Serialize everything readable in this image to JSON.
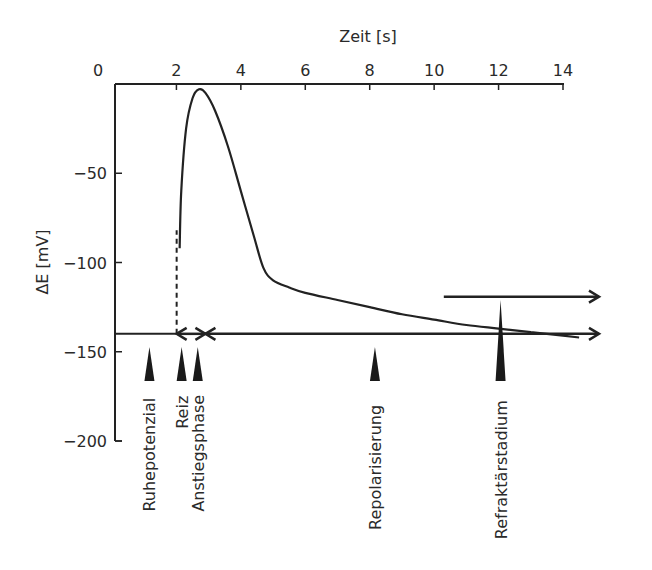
{
  "chart_data": {
    "type": "line",
    "title": "",
    "xlabel": "Zeit [s]",
    "ylabel": "ΔE  [mV]",
    "xlim": [
      0,
      14
    ],
    "ylim": [
      -200,
      0
    ],
    "x_ticks": [
      "0",
      "2",
      "4",
      "6",
      "8",
      "10",
      "12",
      "14"
    ],
    "y_ticks": [
      "−50",
      "−100",
      "−150",
      "−200"
    ],
    "x_axis_position": "top",
    "grid": false,
    "resting_potential_mV": -145,
    "series": [
      {
        "name": "Aktionspotenzial",
        "x": [
          2.1,
          2.15,
          2.3,
          2.5,
          2.7,
          2.9,
          3.2,
          3.6,
          4.0,
          4.4,
          4.7,
          5.0,
          5.5,
          6.0,
          7.0,
          8.0,
          9.0,
          10.0,
          11.0,
          12.0,
          13.0,
          14.0,
          14.5
        ],
        "y": [
          -92,
          -60,
          -25,
          -8,
          -3,
          -5,
          -15,
          -35,
          -60,
          -85,
          -103,
          -110,
          -114,
          -117,
          -121,
          -125,
          -129,
          -132,
          -135,
          -137,
          -139,
          -141,
          -142
        ]
      }
    ],
    "annotations": [
      {
        "label": "Ruhepotenzial",
        "x": 1.1,
        "type": "marker"
      },
      {
        "label": "Reiz",
        "x": 2.1,
        "type": "marker",
        "dashed_line_to_mV": -82
      },
      {
        "label": "Anstiegsphase",
        "x": 2.6,
        "type": "marker"
      },
      {
        "label": "Repolarisierung",
        "x": 8.1,
        "type": "marker"
      },
      {
        "label": "Refraktärstadium",
        "x": 12.0,
        "type": "tall-marker"
      }
    ],
    "arrows": [
      {
        "from_x": 2.1,
        "to_x": 2.9,
        "y_mV": -145,
        "style": "double-headed"
      },
      {
        "from_x": 2.9,
        "to_x": 14.0,
        "y_mV": -145,
        "style": "right-arrow"
      },
      {
        "from_x": 10.3,
        "to_x": 14.0,
        "y_mV": -118,
        "style": "right-arrow"
      }
    ]
  }
}
